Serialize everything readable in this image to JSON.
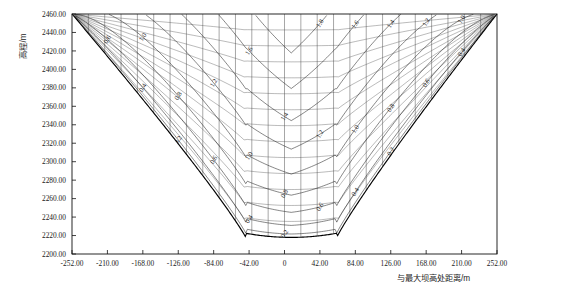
{
  "chart_data": {
    "type": "line",
    "title": "",
    "subtitle": "",
    "xlabel": "与最大坝高处距离/m",
    "ylabel": "高程/m",
    "xlim": [
      -252.0,
      252.0
    ],
    "ylim": [
      2200.0,
      2460.0
    ],
    "grid": false,
    "legend_position": "none",
    "xticks": [
      -252.0,
      -210.0,
      -168.0,
      -126.0,
      -84.0,
      -42.0,
      0,
      42.0,
      84.0,
      126.0,
      168.0,
      210.0,
      252.0
    ],
    "xtick_labels": [
      "-252.00",
      "-210.00",
      "-168.00",
      "-126.00",
      "-84.00",
      "-42.00",
      "0",
      "42.00",
      "84.00",
      "126.00",
      "168.00",
      "210.00",
      "252.00"
    ],
    "yticks": [
      2200.0,
      2220.0,
      2240.0,
      2260.0,
      2280.0,
      2300.0,
      2320.0,
      2340.0,
      2360.0,
      2380.0,
      2400.0,
      2420.0,
      2440.0,
      2460.0
    ],
    "ytick_labels": [
      "2200.00",
      "2220.00",
      "2240.00",
      "2260.00",
      "2280.00",
      "2300.00",
      "2320.00",
      "2340.00",
      "2360.00",
      "2380.00",
      "2400.00",
      "2420.00",
      "2440.00",
      "2460.00"
    ],
    "contour_levels": [
      0.2,
      0.4,
      0.6,
      0.8,
      1.0,
      1.2,
      1.4,
      1.6,
      1.8,
      2.0
    ],
    "contour_level_labels": [
      "0.2",
      "0.4",
      "0.6",
      "0.8",
      "1.0",
      "1.2",
      "1.4",
      "1.6",
      "1.8",
      "2.0"
    ],
    "contour_label_unit": "",
    "valley_profile": {
      "description": "V-shaped river valley cross section, crest at elevation 2460.00 m, bed at about 2218 m",
      "crest_elevation": 2460.0,
      "bed_elevation": 2218.0,
      "left_crest_x": -252.0,
      "right_crest_x": 252.0,
      "bed_left_x": -46.0,
      "bed_right_x": 62.0
    },
    "annotations": []
  },
  "axes": {
    "y_title": "高程/m",
    "x_title": "与最大坝高处距离/m"
  }
}
